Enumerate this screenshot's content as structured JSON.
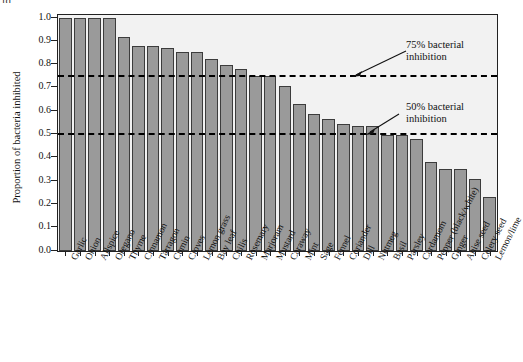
{
  "figure": {
    "top_fragment": "ld",
    "ylabel": "Proportion of bacteria inhibited",
    "annotation_75": "75% bacterial\ninhibition",
    "annotation_75_line1": "75% bacterial",
    "annotation_75_line2": "inhibition",
    "annotation_50_line1": "50% bacterial",
    "annotation_50_line2": "inhibition",
    "bar_fill": "#9a9a9a",
    "bar_stroke": "#3c3c3c",
    "panel_bg": "#f2f2f2",
    "axis_color": "#222222",
    "threshold_color": "#000000"
  },
  "chart_data": {
    "type": "bar",
    "title": "",
    "xlabel": "",
    "ylabel": "Proportion of bacteria inhibited",
    "ylim": [
      0,
      1.0
    ],
    "ytick_labels": [
      "0.0",
      "0.1",
      "0.2",
      "0.3",
      "0.4",
      "0.5",
      "0.6",
      "0.7",
      "0.8",
      "0.9",
      "1.0"
    ],
    "ytick_values": [
      0.0,
      0.1,
      0.2,
      0.3,
      0.4,
      0.5,
      0.6,
      0.7,
      0.8,
      0.9,
      1.0
    ],
    "grid": false,
    "legend": "none",
    "categories": [
      "Garlic",
      "Onion",
      "Allspice",
      "Oregano",
      "Thyme",
      "Cinnamon",
      "Tarragon",
      "Cumin",
      "Cloves",
      "Lemon grass",
      "Bay leaf",
      "Chilis",
      "Rosemary",
      "Marjoram",
      "Mustard",
      "Caraway",
      "Mint",
      "Sage",
      "Fennel",
      "Coriander",
      "Dill",
      "Nutmeg",
      "Basil",
      "Parsley",
      "Cardamom",
      "Pepper (black/white)",
      "Ginger",
      "Anise seed",
      "Celery seed",
      "Lemon/lime"
    ],
    "values": [
      1.0,
      1.0,
      1.0,
      1.0,
      0.92,
      0.88,
      0.88,
      0.87,
      0.855,
      0.855,
      0.825,
      0.8,
      0.78,
      0.75,
      0.75,
      0.71,
      0.63,
      0.59,
      0.565,
      0.545,
      0.535,
      0.535,
      0.5,
      0.5,
      0.48,
      0.38,
      0.35,
      0.35,
      0.31,
      0.23
    ],
    "annotations": [
      {
        "name": "threshold-75",
        "value": 0.75,
        "label": "75% bacterial inhibition",
        "style": "dashed"
      },
      {
        "name": "threshold-50",
        "value": 0.5,
        "label": "50% bacterial inhibition",
        "style": "dashed"
      }
    ]
  }
}
